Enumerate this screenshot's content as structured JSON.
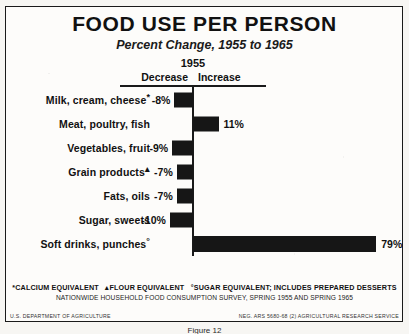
{
  "title": "FOOD USE PER PERSON",
  "subtitle": "Percent Change, 1955 to 1965",
  "axis": {
    "year": "1955",
    "decrease_label": "Decrease",
    "increase_label": "Increase"
  },
  "footnotes": {
    "line1_a": "CALCIUM EQUIVALENT",
    "line1_b": "FLOUR EQUIVALENT",
    "line1_c": "SUGAR EQUIVALENT; INCLUDES PREPARED DESSERTS",
    "marker_a": "*",
    "marker_b": "▴",
    "marker_c": "°",
    "source": "NATIONWIDE HOUSEHOLD FOOD CONSUMPTION SURVEY, SPRING 1955 AND SPRING 1965"
  },
  "credit": {
    "left": "U.S. DEPARTMENT OF AGRICULTURE",
    "right": "NEG. ARS 5680-68 (2) AGRICULTURAL RESEARCH SERVICE"
  },
  "figure_caption": "Figure 12",
  "colors": {
    "bar": "#161616",
    "ink": "#1a1a1a",
    "paper": "#fdfcfa"
  },
  "chart_data": {
    "type": "bar",
    "orientation": "horizontal",
    "title": "FOOD USE PER PERSON",
    "subtitle": "Percent Change, 1955 to 1965",
    "xlabel": "Percent change",
    "ylabel": "",
    "xlim": [
      -12,
      82
    ],
    "grid": false,
    "legend": null,
    "baseline": 0,
    "categories": [
      "Milk, cream, cheese*",
      "Meat, poultry, fish",
      "Vegetables, fruit",
      "Grain products▴",
      "Fats, oils",
      "Sugar, sweets",
      "Soft drinks, punches°"
    ],
    "values": [
      -8,
      11,
      -9,
      -7,
      -7,
      -10,
      79
    ],
    "data_labels": [
      "-8%",
      "11%",
      "-9%",
      "-7%",
      "-7%",
      "-10%",
      "79%"
    ],
    "rows": [
      {
        "label": "Milk, cream, cheese",
        "marker": "*",
        "value": -8,
        "label_text": "-8%"
      },
      {
        "label": "Meat, poultry, fish",
        "marker": "",
        "value": 11,
        "label_text": "11%"
      },
      {
        "label": "Vegetables, fruit",
        "marker": "",
        "value": -9,
        "label_text": "-9%"
      },
      {
        "label": "Grain products",
        "marker": "▴",
        "value": -7,
        "label_text": "-7%"
      },
      {
        "label": "Fats, oils",
        "marker": "",
        "value": -7,
        "label_text": "-7%"
      },
      {
        "label": "Sugar, sweets",
        "marker": "",
        "value": -10,
        "label_text": "-10%"
      },
      {
        "label": "Soft drinks, punches",
        "marker": "°",
        "value": 79,
        "label_text": "79%"
      }
    ]
  }
}
